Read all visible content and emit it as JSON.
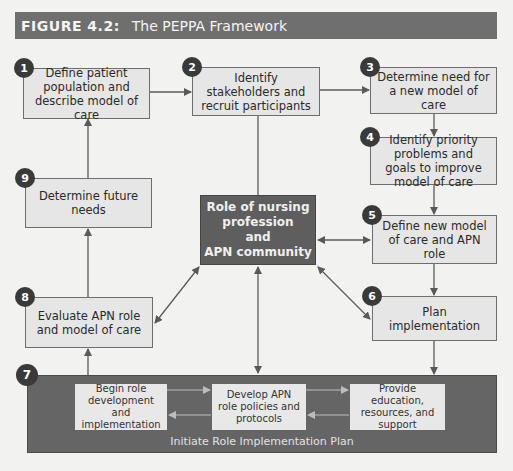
{
  "header": {
    "figure_label": "FIGURE 4.2:",
    "title": "The PEPPA Framework"
  },
  "steps": [
    {
      "number": "1",
      "label": "Define patient population and describe model of care"
    },
    {
      "number": "2",
      "label": "Identify stakeholders and recruit participants"
    },
    {
      "number": "3",
      "label": "Determine need for a new model of care"
    },
    {
      "number": "4",
      "label": "Identify priority problems and goals to improve model of care"
    },
    {
      "number": "5",
      "label": "Define new model of care and APN role"
    },
    {
      "number": "6",
      "label": "Plan implementation"
    },
    {
      "number": "7",
      "label": "Initiate Role Implementation Plan"
    },
    {
      "number": "8",
      "label": "Evaluate APN role and model of care"
    },
    {
      "number": "9",
      "label": "Determine future needs"
    }
  ],
  "center": {
    "line1": "Role of nursing",
    "line2": "profession",
    "line3": "and",
    "line4": "APN community"
  },
  "implementation_plan": {
    "caption": "Initiate Role Implementation Plan",
    "substeps": [
      {
        "label": "Begin role development and implementation"
      },
      {
        "label": "Develop APN role policies and protocols"
      },
      {
        "label": "Provide education, resources, and support"
      }
    ]
  },
  "colors": {
    "header_bg": "#6f6f6f",
    "box_bg": "#e6e6e6",
    "center_bg": "#5e5e5e",
    "banner_bg": "#656565",
    "number_badge": "#3a3a3a"
  }
}
